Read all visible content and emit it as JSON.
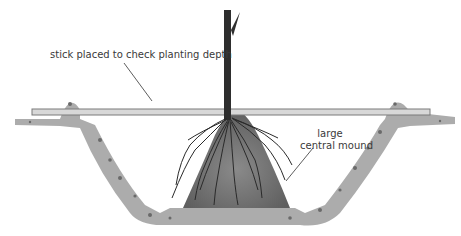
{
  "diagram": {
    "labels": {
      "stick": "stick placed to check planting depth",
      "mound_line1": "large",
      "mound_line2": "central mound"
    },
    "colors": {
      "soil": "#9a9a9a",
      "soil_dark": "#6f6f6f",
      "stick_fill": "#d8d8d8",
      "stick_edge": "#7a7a7a",
      "stem": "#2e2e2e",
      "roots": "#2a2a2a",
      "leader": "#333333"
    }
  }
}
